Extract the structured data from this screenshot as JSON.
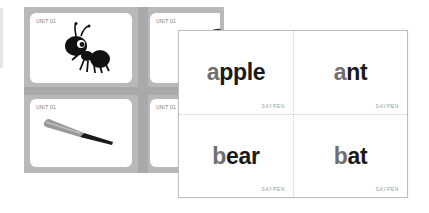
{
  "back_sheet": {
    "cards": [
      {
        "unit": "UNIT 01",
        "image": "ant-illustration"
      },
      {
        "unit": "UNIT 01",
        "image": "apple-illustration"
      },
      {
        "unit": "UNIT 01",
        "image": "bat-illustration"
      },
      {
        "unit": "UNIT 01",
        "image": "bear-illustration"
      }
    ]
  },
  "front_sheet": {
    "cards": [
      {
        "first": "a",
        "rest": "pple",
        "brand": "SAYPEN"
      },
      {
        "first": "a",
        "rest": "nt",
        "brand": "SAYPEN"
      },
      {
        "first": "b",
        "rest": "ear",
        "brand": "SAYPEN"
      },
      {
        "first": "b",
        "rest": "at",
        "brand": "SAYPEN"
      }
    ]
  },
  "colors": {
    "sheet_gray": "#b9b9b9",
    "first_letter": "#6f6f6f",
    "word_text": "#1a1a1a"
  }
}
